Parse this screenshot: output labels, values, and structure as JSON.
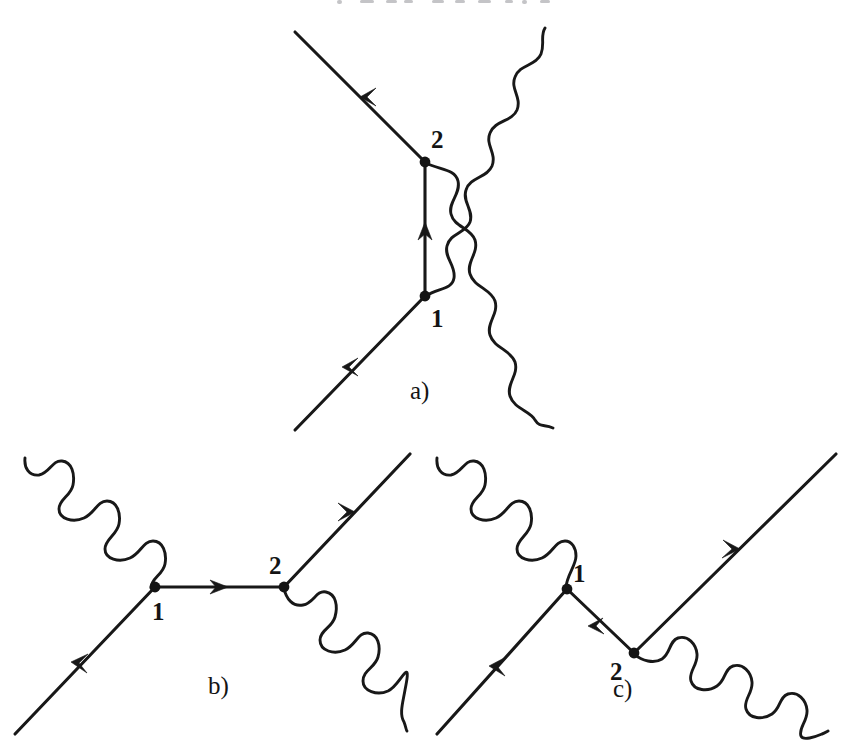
{
  "figure": {
    "background_color": "#ffffff",
    "ink_color": "#181818",
    "width": 847,
    "height": 745
  },
  "panels": [
    {
      "id": "a",
      "caption": "a)",
      "caption_x": 410,
      "caption_y": 399,
      "description": "Crossed-photon vertex diagram with vertical fermion propagator",
      "vertices": [
        {
          "label": "1",
          "x": 425,
          "y": 296,
          "label_x": 431,
          "label_y": 327
        },
        {
          "label": "2",
          "x": 425,
          "y": 162,
          "label_x": 431,
          "label_y": 148
        }
      ],
      "fermion_lines": [
        {
          "name": "incoming-electron",
          "from": [
            295,
            430
          ],
          "to": [
            425,
            296
          ],
          "arrow_at": 0.5
        },
        {
          "name": "outgoing-electron",
          "from": [
            425,
            162
          ],
          "to": [
            295,
            32
          ],
          "arrow_at": 0.5
        },
        {
          "name": "internal-propagator",
          "from": [
            425,
            296
          ],
          "to": [
            425,
            162
          ],
          "arrow_at": 0.5
        }
      ],
      "photon_lines": [
        {
          "name": "photon-from-vertex-1",
          "from": [
            425,
            296
          ],
          "to": [
            545,
            28
          ]
        },
        {
          "name": "photon-from-vertex-2",
          "from": [
            425,
            162
          ],
          "to": [
            553,
            428
          ]
        }
      ]
    },
    {
      "id": "b",
      "caption": "b)",
      "caption_x": 208,
      "caption_y": 694,
      "description": "s-channel Compton scattering diagram",
      "vertices": [
        {
          "label": "1",
          "x": 155,
          "y": 587,
          "label_x": 160,
          "label_y": 619
        },
        {
          "label": "2",
          "x": 284,
          "y": 587,
          "label_x": 269,
          "label_y": 573
        }
      ],
      "fermion_lines": [
        {
          "name": "incoming-electron",
          "from": [
            15,
            734
          ],
          "to": [
            155,
            587
          ],
          "arrow_at": 0.5
        },
        {
          "name": "internal-propagator",
          "from": [
            155,
            587
          ],
          "to": [
            284,
            587
          ],
          "arrow_at": 0.5
        },
        {
          "name": "outgoing-electron",
          "from": [
            284,
            587
          ],
          "to": [
            410,
            454
          ],
          "arrow_at": 0.55
        }
      ],
      "photon_lines": [
        {
          "name": "incoming-photon",
          "from": [
            25,
            458
          ],
          "to": [
            155,
            587
          ]
        },
        {
          "name": "outgoing-photon",
          "from": [
            284,
            587
          ],
          "to": [
            407,
            731
          ]
        }
      ]
    },
    {
      "id": "c",
      "caption": "c)",
      "caption_x": 613,
      "caption_y": 697,
      "description": "u-channel Compton scattering diagram",
      "vertices": [
        {
          "label": "1",
          "x": 567,
          "y": 589,
          "label_x": 577,
          "label_y": 581
        },
        {
          "label": "2",
          "x": 634,
          "y": 653,
          "label_x": 612,
          "label_y": 679
        }
      ],
      "fermion_lines": [
        {
          "name": "incoming-electron",
          "from": [
            437,
            734
          ],
          "to": [
            567,
            589
          ],
          "arrow_at": 0.5
        },
        {
          "name": "internal-propagator",
          "from": [
            567,
            589
          ],
          "to": [
            634,
            653
          ],
          "arrow_at": 0.5
        },
        {
          "name": "outgoing-electron",
          "from": [
            634,
            653
          ],
          "to": [
            836,
            454
          ],
          "arrow_at": 0.5
        }
      ],
      "photon_lines": [
        {
          "name": "incoming-photon",
          "from": [
            437,
            458
          ],
          "to": [
            567,
            589
          ]
        },
        {
          "name": "outgoing-photon",
          "from": [
            634,
            653
          ],
          "to": [
            828,
            731
          ]
        }
      ]
    }
  ]
}
